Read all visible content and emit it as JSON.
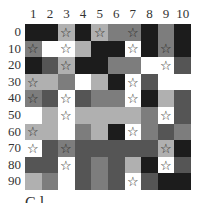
{
  "shades": {
    "B": "#1c1c1c",
    "D": "#555555",
    "M": "#7d7d7d",
    "L": "#b0b0b0",
    "W": "#ffffff"
  },
  "star_glyph": "☆",
  "columns": [
    "1",
    "2",
    "3",
    "4",
    "5",
    "6",
    "7",
    "8",
    "9",
    "10"
  ],
  "rows": [
    {
      "label": "0",
      "cells": [
        "B",
        "B",
        "L",
        "B",
        "L",
        "M",
        "M",
        "B",
        "M",
        "B"
      ],
      "stars": [
        3,
        5,
        7
      ]
    },
    {
      "label": "10",
      "cells": [
        "M",
        "W",
        "W",
        "L",
        "B",
        "B",
        "W",
        "B",
        "M",
        "B"
      ],
      "stars": [
        1,
        3,
        7,
        9
      ]
    },
    {
      "label": "20",
      "cells": [
        "B",
        "D",
        "L",
        "B",
        "B",
        "M",
        "M",
        "W",
        "W",
        "D"
      ],
      "stars": [
        3,
        9
      ]
    },
    {
      "label": "30",
      "cells": [
        "L",
        "L",
        "M",
        "W",
        "L",
        "B",
        "W",
        "D",
        "W",
        "W"
      ],
      "stars": [
        1,
        7
      ]
    },
    {
      "label": "40",
      "cells": [
        "M",
        "D",
        "W",
        "D",
        "M",
        "M",
        "W",
        "B",
        "L",
        "D"
      ],
      "stars": [
        1,
        3,
        7
      ]
    },
    {
      "label": "50",
      "cells": [
        "W",
        "L",
        "W",
        "L",
        "L",
        "L",
        "L",
        "M",
        "W",
        "D"
      ],
      "stars": [
        3,
        9
      ]
    },
    {
      "label": "60",
      "cells": [
        "L",
        "L",
        "W",
        "M",
        "L",
        "B",
        "W",
        "M",
        "D",
        "M"
      ],
      "stars": [
        1,
        7
      ]
    },
    {
      "label": "70",
      "cells": [
        "W",
        "D",
        "M",
        "D",
        "D",
        "D",
        "D",
        "D",
        "L",
        "B"
      ],
      "stars": [
        1,
        3,
        9
      ]
    },
    {
      "label": "80",
      "cells": [
        "D",
        "D",
        "W",
        "D",
        "M",
        "D",
        "L",
        "B",
        "W",
        "D"
      ],
      "stars": [
        3,
        9
      ]
    },
    {
      "label": "90",
      "cells": [
        "L",
        "M",
        "W",
        "D",
        "M",
        "D",
        "W",
        "D",
        "B",
        "B"
      ],
      "stars": [
        7
      ]
    }
  ],
  "footer_text": "C  l"
}
